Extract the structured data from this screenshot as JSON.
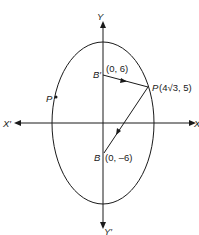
{
  "diagram": {
    "type": "ellipse-focal-distance",
    "axes": {
      "x_positive_label": "X",
      "x_negative_label": "X′",
      "y_positive_label": "Y",
      "y_negative_label": "Y′"
    },
    "points": {
      "b_prime": {
        "name": "B′",
        "coords": "(0, 6)"
      },
      "p_right": {
        "name": "P",
        "coords": "(4√3, 5)"
      },
      "b": {
        "name": "B",
        "coords": "(0, –6)"
      },
      "p_left": {
        "name": "P"
      }
    },
    "colors": {
      "stroke": "#1a1a1a",
      "background": "#ffffff"
    }
  }
}
